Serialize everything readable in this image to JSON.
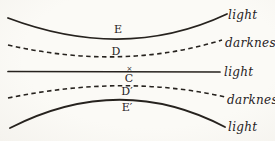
{
  "figure": {
    "ink_color": "#26221e",
    "paper_color": "#faf9f5"
  },
  "points": {
    "E": "E",
    "D": "D",
    "center_mark": "×",
    "C": "C",
    "D_prime": "D′",
    "E_prime": "E′"
  },
  "annotations": {
    "light_top": "light",
    "darkness_upper": "darkness",
    "light_middle": "light",
    "darkness_lower": "darkness",
    "light_bottom": "light"
  }
}
